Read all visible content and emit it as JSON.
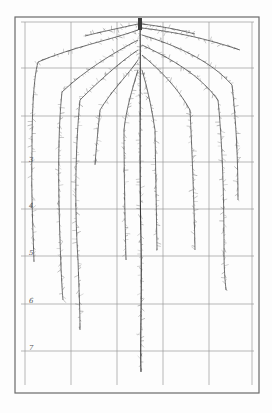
{
  "figure": {
    "type": "botanical root system illustration on measurement grid",
    "colors": {
      "paper": "#fdfdfd",
      "frame": "#6a6a6a",
      "grid": "#9a9a9a",
      "root": "#3a3a3a"
    },
    "frame": {
      "x": 15,
      "y": 17,
      "width": 244,
      "height": 376
    },
    "grid": {
      "vertical_x": [
        25,
        71,
        117,
        163,
        209,
        252
      ],
      "horizontal_y": [
        22,
        68,
        116,
        162,
        209,
        256,
        304,
        351
      ],
      "bottom_y": 385
    },
    "depth_labels": [
      {
        "text": "3",
        "x": 29,
        "y": 157
      },
      {
        "text": "4",
        "x": 29,
        "y": 203
      },
      {
        "text": "5",
        "x": 29,
        "y": 250
      },
      {
        "text": "6",
        "x": 29,
        "y": 298
      },
      {
        "text": "7",
        "x": 29,
        "y": 345
      }
    ],
    "taproot": {
      "x": 140,
      "top_y": 20,
      "bottom_y": 372
    },
    "roots": [
      {
        "name": "far-left",
        "path": "M138,30 C110,40 70,48 38,62 C33,80 32,120 32,150 C31,190 33,230 34,262"
      },
      {
        "name": "left-2",
        "path": "M138,40 C115,52 85,70 62,92 C58,130 58,180 60,240 C61,270 62,290 63,300"
      },
      {
        "name": "left-3",
        "path": "M138,50 C120,62 100,80 80,100 C76,140 74,200 78,260 C79,290 80,310 80,330"
      },
      {
        "name": "left-4",
        "path": "M138,60 C128,75 112,90 100,110 C98,130 96,150 95,165"
      },
      {
        "name": "left-5",
        "path": "M138,70 C132,90 126,110 124,130 C124,170 125,220 126,260"
      },
      {
        "name": "taproot-line",
        "path": "M140,20 C141,80 139,160 141,240 C142,300 140,340 141,372"
      },
      {
        "name": "right-5",
        "path": "M142,70 C148,90 152,110 155,130 C156,170 156,210 157,250"
      },
      {
        "name": "right-4",
        "path": "M142,55 C160,70 178,88 190,110 C192,150 194,200 195,250"
      },
      {
        "name": "right-3",
        "path": "M142,45 C170,58 200,75 218,100 C222,140 224,190 224,250 C224,270 225,280 226,290"
      },
      {
        "name": "right-2",
        "path": "M142,35 C175,45 210,60 232,85 C236,120 238,160 238,200"
      },
      {
        "name": "far-right",
        "path": "M142,28 C175,32 205,38 240,50"
      },
      {
        "name": "top-left-spray",
        "path": "M138,24 C120,28 100,32 85,36"
      },
      {
        "name": "top-right-spray",
        "path": "M142,24 C160,26 180,30 195,34"
      }
    ]
  }
}
